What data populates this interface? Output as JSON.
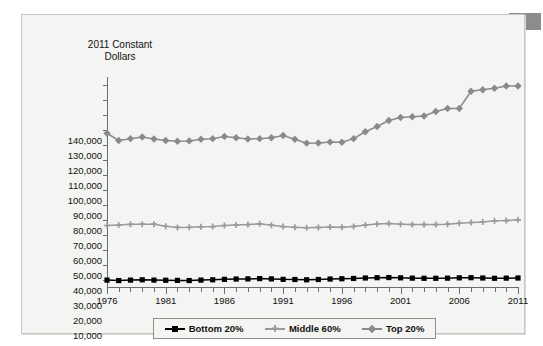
{
  "chart_data": {
    "type": "line",
    "title": "",
    "ylabel": "2011 Constant Dollars",
    "xlabel": "",
    "grid": false,
    "legend_position": "bottom",
    "ylim": [
      0,
      140000
    ],
    "xlim": [
      1976,
      2011
    ],
    "ytick_labels": [
      "140,000",
      "130,000",
      "120,000",
      "110,000",
      "100,000",
      "90,000",
      "80,000",
      "70,000",
      "60,000",
      "50,000",
      "40,000",
      "30,000",
      "20,000",
      "10,000"
    ],
    "ytick_values": [
      140000,
      130000,
      120000,
      110000,
      100000,
      90000,
      80000,
      70000,
      60000,
      50000,
      40000,
      30000,
      20000,
      10000
    ],
    "xtick_labels": [
      "1976",
      "1981",
      "1986",
      "1991",
      "1996",
      "2001",
      "2006",
      "2011"
    ],
    "xtick_values": [
      1976,
      1981,
      1986,
      1991,
      1996,
      2001,
      2006,
      2011
    ],
    "x": [
      1976,
      1977,
      1978,
      1979,
      1980,
      1981,
      1982,
      1983,
      1984,
      1985,
      1986,
      1987,
      1988,
      1989,
      1990,
      1991,
      1992,
      1993,
      1994,
      1995,
      1996,
      1997,
      1998,
      1999,
      2000,
      2001,
      2002,
      2003,
      2004,
      2005,
      2006,
      2007,
      2008,
      2009,
      2010,
      2011
    ],
    "series": [
      {
        "name": "Bottom 20%",
        "color": "#000000",
        "marker": "square",
        "values": [
          10100,
          9800,
          10100,
          10300,
          10100,
          10000,
          9900,
          9800,
          10100,
          10300,
          10600,
          10800,
          10900,
          11100,
          10900,
          10600,
          10500,
          10300,
          10500,
          10800,
          11000,
          11200,
          11500,
          11700,
          11800,
          11600,
          11400,
          11300,
          11300,
          11400,
          11600,
          11700,
          11500,
          11300,
          11400,
          11500
        ]
      },
      {
        "name": "Middle 60%",
        "color": "#9a9a9a",
        "marker": "plus",
        "values": [
          46500,
          46800,
          47300,
          47400,
          47400,
          46000,
          45200,
          45300,
          45600,
          45800,
          46500,
          46800,
          47100,
          47600,
          46700,
          45800,
          45300,
          45000,
          45200,
          45500,
          45300,
          45900,
          46800,
          47500,
          47800,
          47400,
          47100,
          47100,
          47100,
          47400,
          48000,
          48500,
          48900,
          49600,
          49800,
          50300
        ]
      },
      {
        "name": "Top 20%",
        "color": "#8a8a8a",
        "marker": "diamond",
        "values": [
          108000,
          103200,
          104400,
          105500,
          104200,
          103200,
          102700,
          102900,
          104000,
          104400,
          105800,
          105000,
          104200,
          104400,
          105000,
          106500,
          104000,
          101400,
          101500,
          102100,
          102000,
          104400,
          109000,
          112500,
          116500,
          118500,
          119000,
          119500,
          122500,
          124500,
          124500,
          124000,
          122500,
          126000,
          130000,
          134500
        ]
      }
    ],
    "series_note": [
      {
        "name": "Top 20%",
        "extra_points": [
          {
            "x": 2007,
            "y": 136000
          },
          {
            "x": 2008,
            "y": 137000
          },
          {
            "x": 2009,
            "y": 138000
          },
          {
            "x": 2010,
            "y": 139500
          },
          {
            "x": 2011,
            "y": 139500
          }
        ]
      }
    ]
  },
  "legend": {
    "items": [
      {
        "label": "Bottom 20%"
      },
      {
        "label": "Middle 60%"
      },
      {
        "label": "Top 20%"
      }
    ]
  },
  "axis_title": {
    "line1": "2011 Constant",
    "line2": "Dollars"
  }
}
